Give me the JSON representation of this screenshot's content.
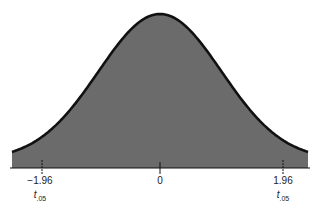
{
  "chart_data": {
    "type": "area",
    "title": "",
    "xlabel": "",
    "ylabel": "",
    "x_ticks": [
      {
        "value": -1.96,
        "label": "-1.96",
        "sublabel": "t",
        "subscript": ".05"
      },
      {
        "value": 0,
        "label": "0"
      },
      {
        "value": 1.96,
        "label": "1.96",
        "sublabel": "t",
        "subscript": ".05"
      }
    ],
    "xlim": [
      -2.5,
      2.5
    ],
    "fill_color": "#6b6b6b",
    "line_color": "#111111"
  },
  "labels": {
    "left_value": "−1.96",
    "left_t": "t",
    "left_sub": ".05",
    "center_value": "0",
    "right_value": "1.96",
    "right_t": "t",
    "right_sub": ".05"
  }
}
